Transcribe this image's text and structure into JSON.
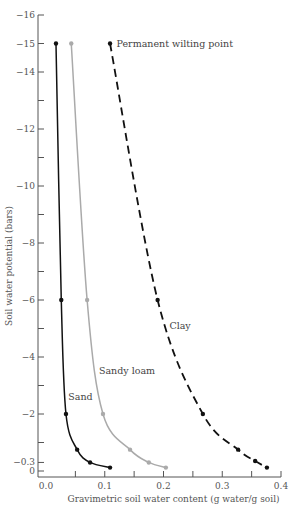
{
  "chart_data": {
    "type": "line",
    "title": "",
    "xlabel": "Gravimetric soil water content (g water/g soil)",
    "ylabel": "Soil water potential (bars)",
    "xlim": [
      0.0,
      0.4
    ],
    "ylim": [
      0,
      -16
    ],
    "x_ticks": [
      {
        "value": 0.0,
        "label": "0.0"
      },
      {
        "value": 0.05,
        "label": ""
      },
      {
        "value": 0.1,
        "label": "0.1"
      },
      {
        "value": 0.15,
        "label": ""
      },
      {
        "value": 0.2,
        "label": "0.2"
      },
      {
        "value": 0.25,
        "label": ""
      },
      {
        "value": 0.3,
        "label": "0.3"
      },
      {
        "value": 0.35,
        "label": ""
      },
      {
        "value": 0.4,
        "label": "0.4"
      }
    ],
    "y_ticks": [
      {
        "value": 0,
        "label": "0"
      },
      {
        "value": -0.3,
        "label": "−0.3"
      },
      {
        "value": -1,
        "label": ""
      },
      {
        "value": -2,
        "label": "−2"
      },
      {
        "value": -3,
        "label": ""
      },
      {
        "value": -4,
        "label": "−4"
      },
      {
        "value": -5,
        "label": ""
      },
      {
        "value": -6,
        "label": "−6"
      },
      {
        "value": -7,
        "label": ""
      },
      {
        "value": -8,
        "label": "−8"
      },
      {
        "value": -9,
        "label": ""
      },
      {
        "value": -10,
        "label": "−10"
      },
      {
        "value": -11,
        "label": ""
      },
      {
        "value": -12,
        "label": "−12"
      },
      {
        "value": -13,
        "label": ""
      },
      {
        "value": -14,
        "label": "−14"
      },
      {
        "value": -15,
        "label": "−15"
      },
      {
        "value": -16,
        "label": "−16"
      }
    ],
    "grid": false,
    "legend": "none",
    "series": [
      {
        "name": "Sand",
        "color": "#111111",
        "style": "solid",
        "points": [
          {
            "x": 0.017,
            "y": -15
          },
          {
            "x": 0.026,
            "y": -6
          },
          {
            "x": 0.034,
            "y": -2
          },
          {
            "x": 0.053,
            "y": -0.75
          },
          {
            "x": 0.075,
            "y": -0.3
          },
          {
            "x": 0.109,
            "y": -0.12
          }
        ],
        "label_at": {
          "x": 0.038,
          "y": -2.5
        }
      },
      {
        "name": "Sandy loam",
        "color": "#aaaaaa",
        "style": "solid",
        "points": [
          {
            "x": 0.043,
            "y": -15
          },
          {
            "x": 0.07,
            "y": -6
          },
          {
            "x": 0.097,
            "y": -2
          },
          {
            "x": 0.143,
            "y": -0.75
          },
          {
            "x": 0.175,
            "y": -0.3
          },
          {
            "x": 0.204,
            "y": -0.12
          }
        ],
        "label_at": {
          "x": 0.09,
          "y": -3.4
        }
      },
      {
        "name": "Clay",
        "color": "#111111",
        "style": "dashed",
        "points": [
          {
            "x": 0.109,
            "y": -15
          },
          {
            "x": 0.19,
            "y": -6
          },
          {
            "x": 0.267,
            "y": -2
          },
          {
            "x": 0.327,
            "y": -0.75
          },
          {
            "x": 0.356,
            "y": -0.35
          },
          {
            "x": 0.376,
            "y": -0.12
          }
        ],
        "label_at": {
          "x": 0.21,
          "y": -5.0
        }
      }
    ],
    "annotations": [
      {
        "text": "Permanent wilting point",
        "at": {
          "x": 0.12,
          "y": -15
        }
      }
    ]
  }
}
